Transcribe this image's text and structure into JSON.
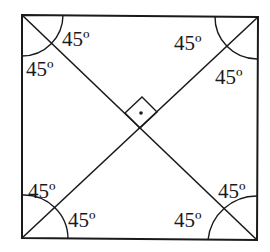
{
  "diagram": {
    "square": {
      "tl": [
        22,
        15
      ],
      "tr": [
        258,
        17
      ],
      "br": [
        257,
        240
      ],
      "bl": [
        22,
        238
      ]
    },
    "center": [
      140,
      128
    ],
    "stroke_color": "#1a1a1a",
    "angle_labels": [
      {
        "id": "tl-upper",
        "text": "45º",
        "x": 62,
        "y": 46
      },
      {
        "id": "tl-lower",
        "text": "45º",
        "x": 26,
        "y": 76
      },
      {
        "id": "tr-upper",
        "text": "45º",
        "x": 174,
        "y": 50
      },
      {
        "id": "tr-lower",
        "text": "45º",
        "x": 215,
        "y": 84
      },
      {
        "id": "bl-upper",
        "text": "45º",
        "x": 28,
        "y": 198
      },
      {
        "id": "bl-lower",
        "text": "45º",
        "x": 68,
        "y": 227
      },
      {
        "id": "br-upper",
        "text": "45º",
        "x": 218,
        "y": 198
      },
      {
        "id": "br-lower",
        "text": "45º",
        "x": 174,
        "y": 227
      }
    ],
    "right_angle_marker": {
      "dot": true
    }
  }
}
